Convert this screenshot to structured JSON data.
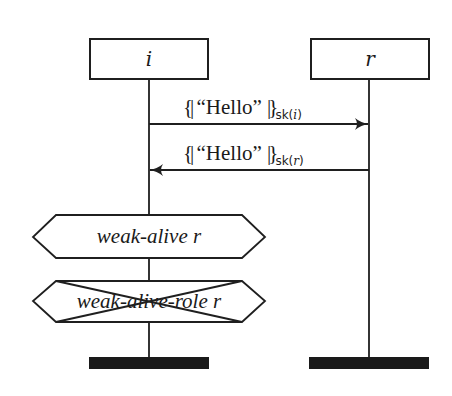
{
  "diagram": {
    "type": "message-sequence-chart",
    "roles": [
      {
        "id": "i",
        "label": "i"
      },
      {
        "id": "r",
        "label": "r"
      }
    ],
    "messages": [
      {
        "from": "i",
        "to": "r",
        "open_bracket": "{|",
        "payload": "“Hello”",
        "close_bracket": "|}",
        "key_fn": "sk",
        "key_arg": "i",
        "direction": "right"
      },
      {
        "from": "r",
        "to": "i",
        "open_bracket": "{|",
        "payload": "“Hello”",
        "close_bracket": "|}",
        "key_fn": "sk",
        "key_arg": "r",
        "direction": "left"
      }
    ],
    "claims": [
      {
        "role": "i",
        "label": "weak-alive r",
        "crossed_out": false
      },
      {
        "role": "i",
        "label": "weak-alive-role r",
        "crossed_out": true
      }
    ],
    "terminators": [
      {
        "role": "i"
      },
      {
        "role": "r"
      }
    ],
    "colors": {
      "line": "#1f1f1f",
      "background": "#ffffff",
      "bar": "#1a1a1a"
    }
  }
}
